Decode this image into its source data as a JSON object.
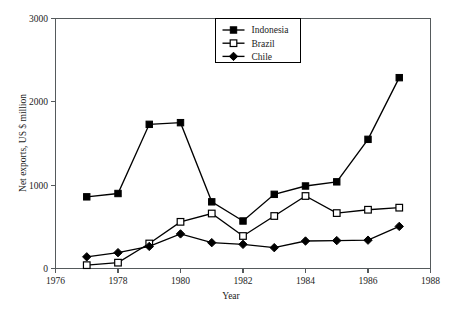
{
  "chart_data": {
    "type": "line",
    "title": "",
    "xlabel": "Year",
    "ylabel": "Net exports, US $ million",
    "xlim": [
      1976,
      1988
    ],
    "ylim": [
      0,
      3000
    ],
    "xticks": [
      1976,
      1978,
      1980,
      1982,
      1984,
      1986,
      1988
    ],
    "yticks": [
      0,
      1000,
      2000,
      3000
    ],
    "xtick_labels": [
      "1976",
      "1978",
      "1980",
      "1982",
      "1984",
      "1986",
      "1988"
    ],
    "ytick_labels": [
      "0",
      "1000",
      "2000",
      "3000"
    ],
    "grid": false,
    "legend_position": "top-center",
    "x": [
      1977,
      1978,
      1979,
      1980,
      1981,
      1982,
      1983,
      1984,
      1985,
      1986,
      1987
    ],
    "series": [
      {
        "name": "Indonesia",
        "marker": "filled-square",
        "color": "#000000",
        "values": [
          860,
          900,
          1730,
          1750,
          800,
          570,
          890,
          990,
          1040,
          1550,
          2290
        ]
      },
      {
        "name": "Brazil",
        "marker": "open-square",
        "color": "#000000",
        "values": [
          40,
          70,
          300,
          560,
          660,
          390,
          630,
          870,
          665,
          705,
          730
        ]
      },
      {
        "name": "Chile",
        "marker": "filled-diamond",
        "color": "#000000",
        "values": [
          140,
          190,
          265,
          415,
          310,
          290,
          250,
          330,
          335,
          340,
          505
        ]
      }
    ]
  },
  "legend": {
    "entries": [
      {
        "label": "Indonesia"
      },
      {
        "label": "Brazil"
      },
      {
        "label": "Chile"
      }
    ]
  },
  "axes": {
    "x_title": "Year",
    "y_title": "Net exports, US $ million"
  }
}
